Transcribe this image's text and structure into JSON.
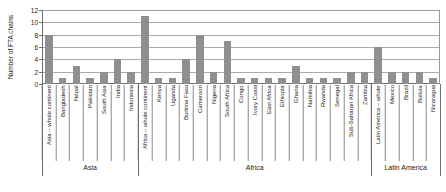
{
  "chart_data": {
    "type": "bar",
    "title": "",
    "xlabel": "",
    "ylabel": "Number of FTA chains",
    "ylim": [
      0,
      12
    ],
    "yticks": [
      0,
      2,
      4,
      6,
      8,
      10,
      12
    ],
    "grid": true,
    "legend": false,
    "bar_color": "#8f8f8f",
    "gridline_color": "#aaaaaa",
    "categories": [
      "Asia – whole continent",
      "Bangladesh",
      "Nepal",
      "Pakistan",
      "South Asia",
      "India",
      "Indonesia",
      "Africa – whole continent",
      "Kenya",
      "Uganda",
      "Burkina Faso",
      "Cameroon",
      "Nigeria",
      "South Africa",
      "Congo",
      "Ivory Coast",
      "East Africa",
      "Ethiopia",
      "Ghana",
      "Namibia",
      "Rwanda",
      "Senegal",
      "Sub-Saharan Africa",
      "Zambia",
      "Latin America – whole",
      "Mexico",
      "Brazil",
      "Bolivia",
      "Nicaragua"
    ],
    "values": [
      8,
      1,
      3,
      1,
      2,
      4,
      2,
      11,
      1,
      1,
      4,
      8,
      2,
      7,
      1,
      1,
      1,
      1,
      3,
      1,
      1,
      1,
      2,
      2,
      6,
      2,
      2,
      2,
      1
    ],
    "groups": [
      {
        "label": "Asia",
        "start": 0,
        "count": 7
      },
      {
        "label": "Africa",
        "start": 7,
        "count": 17
      },
      {
        "label": "Latin America",
        "start": 24,
        "count": 5
      }
    ]
  }
}
